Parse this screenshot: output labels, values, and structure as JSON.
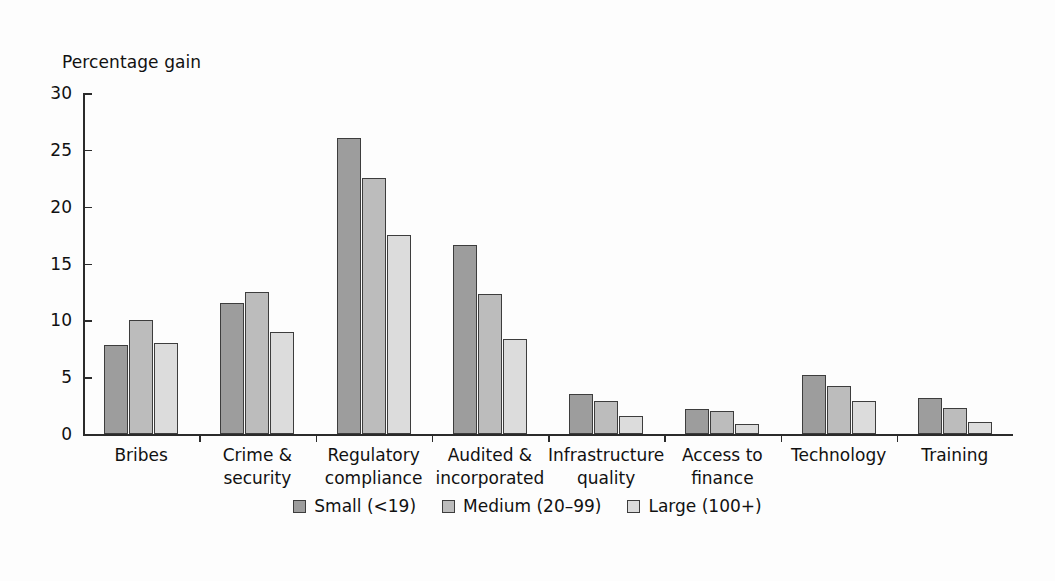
{
  "chart_data": {
    "type": "bar",
    "title": "",
    "xlabel": "",
    "ylabel": "Percentage gain",
    "ylim": [
      0,
      30
    ],
    "yticks": [
      0,
      5,
      10,
      15,
      20,
      25,
      30
    ],
    "ytick_labels": [
      "0",
      "5",
      "10",
      "15",
      "20",
      "25",
      "30"
    ],
    "grid": false,
    "legend_position": "bottom-center",
    "categories": [
      "Bribes",
      "Crime & security",
      "Regulatory compliance",
      "Audited & incorporated",
      "Infrastructure quality",
      "Access to finance",
      "Technology",
      "Training"
    ],
    "category_lines": [
      [
        "Bribes"
      ],
      [
        "Crime &",
        "security"
      ],
      [
        "Regulatory",
        "compliance"
      ],
      [
        "Audited &",
        "incorporated"
      ],
      [
        "Infrastructure",
        "quality"
      ],
      [
        "Access to",
        "finance"
      ],
      [
        "Technology"
      ],
      [
        "Training"
      ]
    ],
    "series": [
      {
        "name": "Small (<19)",
        "color": "#9d9d9d",
        "values": [
          7.8,
          11.5,
          26.0,
          16.6,
          3.5,
          2.2,
          5.2,
          3.2
        ]
      },
      {
        "name": "Medium (20–99)",
        "color": "#bcbcbc",
        "values": [
          10.0,
          12.5,
          22.5,
          12.3,
          2.9,
          2.0,
          4.2,
          2.3
        ]
      },
      {
        "name": "Large (100+)",
        "color": "#dcdcdc",
        "values": [
          8.0,
          9.0,
          17.5,
          8.4,
          1.6,
          0.9,
          2.9,
          1.1
        ]
      }
    ]
  },
  "axis": {
    "y_title": "Percentage gain"
  },
  "legend": {
    "items": [
      {
        "label": "Small (<19)",
        "color": "#9d9d9d"
      },
      {
        "label": "Medium (20–99)",
        "color": "#bcbcbc"
      },
      {
        "label": "Large (100+)",
        "color": "#dcdcdc"
      }
    ]
  },
  "colors": {
    "axis": "#2b2b2b",
    "bar_outline": "#3d3d3d",
    "text": "#111111",
    "background": "#fdfdfd"
  }
}
